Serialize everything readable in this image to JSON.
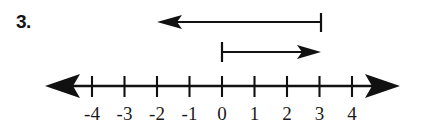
{
  "problem": {
    "number_label": "3."
  },
  "figure": {
    "type": "number-line-vector-diagram",
    "line_color": "#111111",
    "axis": {
      "y": 86,
      "left_arrow_tip_x": 45,
      "right_arrow_tip_x": 400,
      "tick_spacing_px": 32.5,
      "origin_x": 222,
      "tick_values": [
        -4,
        -3,
        -2,
        -1,
        0,
        1,
        2,
        3,
        4
      ],
      "tick_labels": [
        "-4",
        "-3",
        "-2",
        "-1",
        "0",
        "1",
        "2",
        "3",
        "4"
      ]
    },
    "vectors": [
      {
        "name": "upper-vector",
        "label": "",
        "start_value": 3,
        "end_value": -5,
        "direction": "left",
        "y": 22,
        "start_x": 321,
        "end_x": 158,
        "has_start_bar": true,
        "has_arrowhead": true
      },
      {
        "name": "lower-vector",
        "label": "",
        "start_value": 0,
        "end_value": 3,
        "direction": "right",
        "y": 52,
        "start_x": 222,
        "end_x": 320,
        "has_start_bar": true,
        "has_arrowhead": true
      }
    ]
  }
}
